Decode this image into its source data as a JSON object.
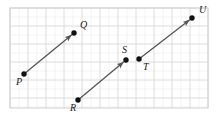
{
  "figure": {
    "canvas": {
      "width": 216,
      "height": 120,
      "background": "#ffffff"
    },
    "grid": {
      "x0": 10,
      "y0": 8,
      "x1": 208,
      "y1": 108,
      "minor_spacing": 9,
      "major_spacing": 18,
      "minor_color": "#eeeeee",
      "major_color": "#d8d8d8",
      "border_color": "#d0d0d0"
    },
    "style": {
      "segment_color": "#555555",
      "segment_width": 1.3,
      "dot_color": "#111111",
      "dot_radius": 2.7,
      "label_color": "#1a1a1a",
      "label_size": 10
    },
    "points": [
      {
        "id": "P",
        "label": "P",
        "x": 24,
        "y": 74,
        "label_x": 16,
        "label_y": 85
      },
      {
        "id": "Q",
        "label": "Q",
        "x": 74,
        "y": 33,
        "label_x": 80,
        "label_y": 28
      },
      {
        "id": "R",
        "label": "R",
        "x": 78,
        "y": 100,
        "label_x": 70,
        "label_y": 111
      },
      {
        "id": "S",
        "label": "S",
        "x": 126,
        "y": 60,
        "label_x": 122,
        "label_y": 53
      },
      {
        "id": "T",
        "label": "T",
        "x": 139,
        "y": 59,
        "label_x": 143,
        "label_y": 70
      },
      {
        "id": "U",
        "label": "U",
        "x": 192,
        "y": 18,
        "label_x": 199,
        "label_y": 13
      }
    ],
    "segments": [
      {
        "id": "PQ",
        "name": "ray-p-q",
        "from": "P",
        "to": "Q",
        "x1": 24,
        "y1": 74,
        "x2": 74,
        "y2": 33,
        "arrow_at_end": true
      },
      {
        "id": "RS",
        "name": "ray-r-s",
        "from": "R",
        "to": "S",
        "x1": 78,
        "y1": 100,
        "x2": 126,
        "y2": 60,
        "arrow_at_end": true
      },
      {
        "id": "TU",
        "name": "ray-t-u",
        "from": "T",
        "to": "U",
        "x1": 139,
        "y1": 59,
        "x2": 192,
        "y2": 18,
        "arrow_at_end": true
      }
    ]
  }
}
